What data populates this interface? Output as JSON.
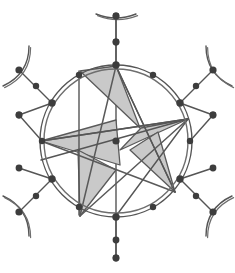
{
  "figure": {
    "type": "geometric-structure-diagram",
    "canvas": {
      "width": 235,
      "height": 273,
      "background": "#ffffff"
    },
    "colors": {
      "stroke": "#555555",
      "stroke_light": "#6e6e6e",
      "node_fill": "#3d3d3d",
      "triangle_fill": "#c9c9c9",
      "triangle_stroke": "#5a5a5a",
      "background": "#ffffff"
    },
    "ring": {
      "center_x": 116,
      "center_y": 141,
      "outer_radius": 76,
      "inner_radius": 72,
      "stroke_width": 1.4
    },
    "center_node": {
      "x": 116,
      "y": 141,
      "r": 3.6
    },
    "ring_nodes": [
      {
        "id": "n0",
        "x": 116.0,
        "y": 65.0,
        "angle_deg": 90,
        "r": 3.7
      },
      {
        "id": "n1",
        "x": 153.0,
        "y": 75.0,
        "angle_deg": 60,
        "r": 3.2
      },
      {
        "id": "n2",
        "x": 180.0,
        "y": 103.0,
        "angle_deg": 30,
        "r": 3.7
      },
      {
        "id": "n3",
        "x": 190.0,
        "y": 141.0,
        "angle_deg": 0,
        "r": 3.2
      },
      {
        "id": "n4",
        "x": 180.0,
        "y": 179.0,
        "angle_deg": -30,
        "r": 3.7
      },
      {
        "id": "n5",
        "x": 153.0,
        "y": 207.0,
        "angle_deg": -60,
        "r": 3.2
      },
      {
        "id": "n6",
        "x": 116.0,
        "y": 217.0,
        "angle_deg": -90,
        "r": 3.7
      },
      {
        "id": "n7",
        "x": 79.0,
        "y": 207.0,
        "angle_deg": 240,
        "r": 3.2
      },
      {
        "id": "n8",
        "x": 52.0,
        "y": 179.0,
        "angle_deg": 210,
        "r": 3.7
      },
      {
        "id": "n9",
        "x": 42.0,
        "y": 141.0,
        "angle_deg": 180,
        "r": 3.2
      },
      {
        "id": "n10",
        "x": 52.0,
        "y": 103.0,
        "angle_deg": 150,
        "r": 3.7
      },
      {
        "id": "n11",
        "x": 79.0,
        "y": 75.0,
        "angle_deg": 120,
        "r": 3.2
      }
    ],
    "spokes": [
      {
        "from": "n0",
        "mid_x": 116.0,
        "mid_y": 42.0,
        "end_x": 116.0,
        "end_y": 16.0,
        "has_mid_node": true,
        "mid_r": 3.4,
        "end_node": true,
        "end_r": 3.4,
        "arc": "top"
      },
      {
        "from": "n2",
        "mid_x": 196.0,
        "mid_y": 86.0,
        "end_x": 213.0,
        "end_y": 70.0,
        "has_mid_node": true,
        "mid_r": 3.2,
        "end_node": true,
        "end_r": 3.6,
        "arc": "upper-right"
      },
      {
        "from": "n3",
        "mid_x": 213.0,
        "mid_y": 141.0,
        "end_x": 213.0,
        "end_y": 115.0,
        "has_mid_node": false,
        "mid_r": 0,
        "end_node": true,
        "end_r": 3.4,
        "arc": "none"
      },
      {
        "from": "n4",
        "mid_x": 196.0,
        "mid_y": 196.0,
        "end_x": 213.0,
        "end_y": 212.0,
        "has_mid_node": true,
        "mid_r": 3.2,
        "end_node": true,
        "end_r": 3.6,
        "arc": "lower-right"
      },
      {
        "from": "n6",
        "mid_x": 116.0,
        "mid_y": 240.0,
        "end_x": 116.0,
        "end_y": 258.0,
        "has_mid_node": false,
        "mid_r": 0,
        "end_node": true,
        "end_r": 3.4,
        "arc": "none"
      },
      {
        "from": "n8",
        "mid_x": 36.0,
        "mid_y": 196.0,
        "end_x": 19.0,
        "end_y": 212.0,
        "has_mid_node": true,
        "mid_r": 3.2,
        "end_node": true,
        "end_r": 3.6,
        "arc": "lower-left"
      },
      {
        "from": "n9",
        "mid_x": 19.0,
        "mid_y": 141.0,
        "end_x": 19.0,
        "end_y": 115.0,
        "has_mid_node": false,
        "mid_r": 0,
        "end_node": true,
        "end_r": 3.4,
        "arc": "none"
      },
      {
        "from": "n10",
        "mid_x": 36.0,
        "mid_y": 86.0,
        "end_x": 19.0,
        "end_y": 70.0,
        "has_mid_node": true,
        "mid_r": 3.2,
        "end_node": true,
        "end_r": 3.6,
        "arc": "upper-left"
      }
    ],
    "side_nodes": [
      {
        "id": "s-left-upper",
        "x": 19.0,
        "y": 115.0,
        "r": 3.4
      },
      {
        "id": "s-left-lower",
        "x": 19.0,
        "y": 168.0,
        "r": 3.4
      },
      {
        "id": "s-right-upper",
        "x": 213.0,
        "y": 115.0,
        "r": 3.4
      },
      {
        "id": "s-right-lower",
        "x": 213.0,
        "y": 168.0,
        "r": 3.4
      }
    ],
    "star": {
      "description": "Five-pointed star (pentagram) with alternating shaded triangles",
      "points": 5,
      "vertices": [
        {
          "id": "v-top",
          "x": 116.0,
          "y": 66.0
        },
        {
          "id": "v-upper-right",
          "x": 188.0,
          "y": 119.0
        },
        {
          "id": "v-lower-right",
          "x": 175.0,
          "y": 192.0
        },
        {
          "id": "v-lower-left",
          "x": 80.0,
          "y": 216.0
        },
        {
          "id": "v-left",
          "x": 41.0,
          "y": 141.0
        }
      ],
      "shaded_triangles": [
        {
          "id": "tri-top",
          "pts": "80,71 116,66 140,128"
        },
        {
          "id": "tri-right",
          "pts": "188,119 120,150 141,128"
        },
        {
          "id": "tri-lower-right",
          "pts": "175,192 130,150 158,132"
        },
        {
          "id": "tri-left",
          "pts": "41,141 116,120 120,165"
        },
        {
          "id": "tri-lower-left",
          "pts": "80,216 78,150 116,170"
        }
      ]
    },
    "chords": [
      {
        "id": "chord-a",
        "x1": 79.0,
        "y1": 71.0,
        "x2": 79.0,
        "y2": 215.0
      },
      {
        "id": "chord-b",
        "x1": 41.0,
        "y1": 141.0,
        "x2": 188.0,
        "y2": 119.0
      },
      {
        "id": "chord-c",
        "x1": 41.0,
        "y1": 160.0,
        "x2": 188.0,
        "y2": 119.0
      },
      {
        "id": "chord-d",
        "x1": 116.0,
        "y1": 66.0,
        "x2": 175.0,
        "y2": 192.0
      },
      {
        "id": "chord-e",
        "x1": 188.0,
        "y1": 119.0,
        "x2": 116.0,
        "y2": 216.0
      }
    ]
  }
}
